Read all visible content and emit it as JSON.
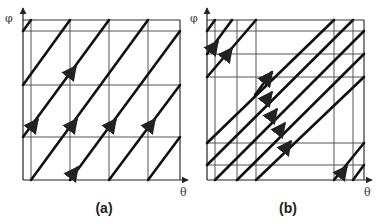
{
  "panels": [
    {
      "id": "a",
      "caption": "(a)",
      "x_axis_label": "θ",
      "y_axis_label": "φ",
      "box": {
        "left": 23,
        "right": 180,
        "top": 20,
        "bottom": 180
      },
      "vertical_lines": [
        31,
        70,
        109,
        148
      ],
      "horizontal_lines": [
        31,
        85,
        137
      ],
      "trajectories": [
        [
          [
            23,
            31
          ],
          [
            31,
            20
          ]
        ],
        [
          [
            23,
            85
          ],
          [
            70,
            20
          ]
        ],
        [
          [
            23,
            137
          ],
          [
            109,
            20
          ]
        ],
        [
          [
            31,
            180
          ],
          [
            148,
            20
          ]
        ],
        [
          [
            70,
            180
          ],
          [
            180,
            31
          ]
        ],
        [
          [
            109,
            180
          ],
          [
            180,
            85
          ]
        ],
        [
          [
            148,
            180
          ],
          [
            180,
            137
          ]
        ]
      ],
      "arrows": [
        [
          76,
          66
        ],
        [
          38,
          119
        ],
        [
          77,
          119
        ],
        [
          116,
          119
        ],
        [
          155,
          119
        ],
        [
          78,
          167
        ]
      ]
    },
    {
      "id": "b",
      "caption": "(b)",
      "x_axis_label": "θ",
      "y_axis_label": "φ",
      "box": {
        "left": 207,
        "right": 364,
        "top": 20,
        "bottom": 180
      },
      "vertical_lines": [
        215,
        237,
        256,
        334,
        353
      ],
      "horizontal_lines": [
        31,
        54,
        77,
        143,
        165
      ],
      "trajectories": [
        [
          [
            207,
            31
          ],
          [
            215,
            20
          ]
        ],
        [
          [
            207,
            54
          ],
          [
            232,
            20
          ]
        ],
        [
          [
            207,
            77
          ],
          [
            256,
            20
          ]
        ],
        [
          [
            207,
            143
          ],
          [
            334,
            20
          ]
        ],
        [
          [
            207,
            165
          ],
          [
            353,
            20
          ]
        ],
        [
          [
            215,
            180
          ],
          [
            364,
            31
          ]
        ],
        [
          [
            237,
            180
          ],
          [
            364,
            54
          ]
        ],
        [
          [
            256,
            180
          ],
          [
            364,
            77
          ]
        ],
        [
          [
            334,
            180
          ],
          [
            364,
            143
          ]
        ],
        [
          [
            353,
            180
          ],
          [
            364,
            165
          ]
        ]
      ],
      "short_trajectory": [
        [
          255,
          95
        ],
        [
          272,
          72
        ]
      ],
      "arrows": [
        [
          218,
          41
        ],
        [
          232,
          48
        ],
        [
          272,
          72
        ],
        [
          272,
          92
        ],
        [
          277,
          109
        ],
        [
          285,
          123
        ],
        [
          291,
          141
        ],
        [
          347,
          166
        ]
      ]
    }
  ]
}
